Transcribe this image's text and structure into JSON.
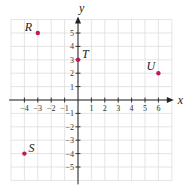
{
  "chart_data": {
    "type": "scatter",
    "title": "",
    "xlabel": "x",
    "ylabel": "y",
    "xlim": [
      -5,
      7
    ],
    "ylim": [
      -6,
      6
    ],
    "grid": true,
    "x_ticks": [
      -4,
      -3,
      -2,
      -1,
      1,
      2,
      3,
      4,
      5,
      6
    ],
    "y_ticks": [
      5,
      4,
      3,
      2,
      1,
      -1,
      -2,
      -3,
      -4,
      -5
    ],
    "x_tick_labels": [
      "−4",
      "−3",
      "−2",
      "−1",
      "1",
      "2",
      "3",
      "4",
      "5",
      "6"
    ],
    "y_tick_labels": [
      "5",
      "4",
      "3",
      "2",
      "1",
      "−1",
      "−2",
      "−3",
      "−4",
      "−5"
    ],
    "points": [
      {
        "label": "R",
        "x": -3,
        "y": 5
      },
      {
        "label": "T",
        "x": 0,
        "y": 3
      },
      {
        "label": "U",
        "x": 6,
        "y": 2
      },
      {
        "label": "S",
        "x": -4,
        "y": -4
      }
    ],
    "colors": {
      "point": "#c2185b",
      "grid": "#d8d8d8",
      "axis": "#222222"
    }
  }
}
